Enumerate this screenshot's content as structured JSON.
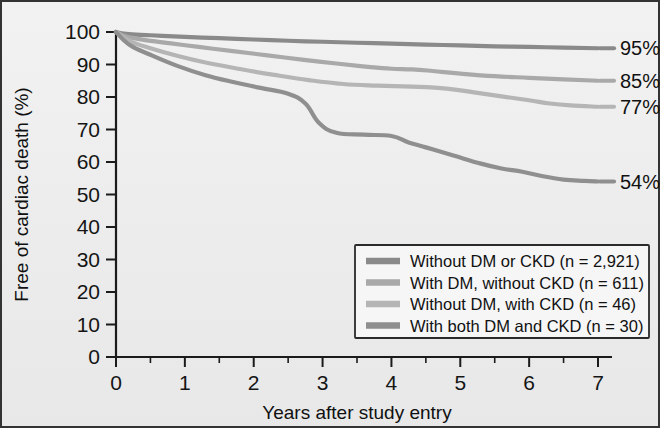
{
  "chart_data": {
    "type": "line",
    "title": "",
    "xlabel": "Years after study entry",
    "ylabel": "Free of cardiac death (%)",
    "xlim": [
      0,
      7
    ],
    "ylim": [
      0,
      100
    ],
    "grid": false,
    "legend_position": "bottom-right",
    "x_ticks": [
      "0",
      "1",
      "2",
      "3",
      "4",
      "5",
      "6",
      "7"
    ],
    "x_tick_values": [
      0,
      1,
      2,
      3,
      4,
      5,
      6,
      7
    ],
    "x_minor_tick_values": [
      0.5,
      1.5,
      2.5,
      3.5,
      4.5,
      5.5,
      6.5
    ],
    "y_ticks": [
      "0",
      "10",
      "20",
      "30",
      "40",
      "50",
      "60",
      "70",
      "80",
      "90",
      "100"
    ],
    "y_tick_values": [
      0,
      10,
      20,
      30,
      40,
      50,
      60,
      70,
      80,
      90,
      100
    ],
    "series": [
      {
        "name": "Without DM or CKD (n = 2,921)",
        "color": "#8a8a8a",
        "end_label": "95%",
        "end_value": 95,
        "x": [
          0,
          0.15,
          0.5,
          1,
          1.5,
          2,
          2.5,
          3,
          3.5,
          4,
          4.5,
          5,
          5.5,
          6,
          6.5,
          7
        ],
        "y": [
          100,
          99.4,
          99.0,
          98.5,
          98.1,
          97.7,
          97.3,
          97.0,
          96.7,
          96.4,
          96.1,
          95.9,
          95.6,
          95.4,
          95.2,
          95.0
        ]
      },
      {
        "name": "With DM, without CKD (n = 611)",
        "color": "#a9a9a9",
        "end_label": "85%",
        "end_value": 85,
        "x": [
          0,
          0.15,
          0.4,
          0.8,
          1.2,
          1.7,
          2.2,
          2.7,
          3.2,
          3.7,
          4.0,
          4.3,
          4.6,
          5.0,
          5.5,
          6.0,
          6.5,
          7
        ],
        "y": [
          100,
          98.6,
          97.6,
          96.5,
          95.4,
          94.1,
          92.8,
          91.5,
          90.3,
          89.2,
          88.7,
          88.5,
          88.0,
          87.2,
          86.4,
          85.9,
          85.4,
          85.0
        ]
      },
      {
        "name": "Without DM, with CKD (n = 46)",
        "color": "#b5b5b5",
        "end_label": "77%",
        "end_value": 77,
        "x": [
          0,
          0.2,
          0.5,
          0.9,
          1.3,
          1.8,
          2.3,
          2.8,
          3.3,
          3.8,
          4.3,
          4.8,
          5.2,
          5.6,
          6.0,
          6.3,
          6.6,
          7
        ],
        "y": [
          100,
          97.2,
          95.0,
          92.6,
          90.6,
          88.6,
          86.8,
          85.2,
          84.0,
          83.5,
          83.2,
          82.6,
          81.4,
          80.2,
          79.0,
          78.0,
          77.4,
          77.0
        ]
      },
      {
        "name": "With both DM and CKD (n = 30)",
        "color": "#8f8f8f",
        "end_label": "54%",
        "end_value": 54,
        "x": [
          0,
          0.2,
          0.5,
          0.9,
          1.3,
          1.7,
          2.1,
          2.5,
          2.75,
          2.95,
          3.2,
          3.6,
          4.0,
          4.25,
          4.5,
          4.9,
          5.3,
          5.6,
          5.9,
          6.2,
          6.5,
          6.8,
          7
        ],
        "y": [
          100,
          96.0,
          93.0,
          89.5,
          86.7,
          84.6,
          82.8,
          81.0,
          78.0,
          72.0,
          69.0,
          68.4,
          68.0,
          66.0,
          64.5,
          62.0,
          59.5,
          58.0,
          57.0,
          55.6,
          54.6,
          54.2,
          54.0
        ]
      }
    ]
  },
  "legend": {
    "items": [
      {
        "label": "Without DM or CKD (n = 2,921)"
      },
      {
        "label": "With DM, without CKD (n = 611)"
      },
      {
        "label": "Without DM, with CKD (n = 46)"
      },
      {
        "label": "With both DM and CKD (n = 30)"
      }
    ]
  }
}
